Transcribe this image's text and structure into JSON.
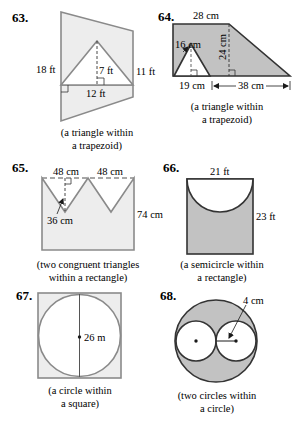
{
  "colors": {
    "light_fill": "#ededed",
    "dark_fill": "#c2c2c2",
    "stroke_gray": "#8a8a8a",
    "stroke_dark": "#333333",
    "text": "#1a1a1a"
  },
  "problems": [
    {
      "number": "63.",
      "labels": {
        "left_side": "18 ft",
        "right_side": "11 ft",
        "triangle_height": "7 ft",
        "triangle_base": "12 ft"
      },
      "caption": [
        "(a triangle within",
        "a trapezoid)"
      ]
    },
    {
      "number": "64.",
      "labels": {
        "top_base": "28 cm",
        "triangle_side": "16 cm",
        "height": "24 cm",
        "triangle_base": "19 cm",
        "right_segment": "38 cm"
      },
      "caption": [
        "(a triangle within",
        "a trapezoid)"
      ]
    },
    {
      "number": "65.",
      "labels": {
        "top_left": "48 cm",
        "top_right": "48 cm",
        "triangle_height": "36 cm",
        "right_side": "74 cm"
      },
      "caption": [
        "(two congruent triangles",
        "within a rectangle)"
      ]
    },
    {
      "number": "66.",
      "labels": {
        "top": "21 ft",
        "right_side": "23 ft"
      },
      "caption": [
        "(a semicircle within",
        "a rectangle)"
      ]
    },
    {
      "number": "67.",
      "labels": {
        "diameter": "26 m"
      },
      "caption": [
        "(a circle within",
        "a square)"
      ]
    },
    {
      "number": "68.",
      "labels": {
        "radius": "4 cm"
      },
      "caption": [
        "(two circles within",
        "a circle)"
      ]
    }
  ]
}
